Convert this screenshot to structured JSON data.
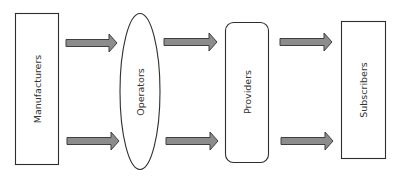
{
  "diagram": {
    "type": "flow",
    "direction": "left-to-right",
    "colors": {
      "background": "#ffffff",
      "node_stroke": "#2e2e2e",
      "node_fill": "#ffffff",
      "arrow_fill": "#8c8c8c",
      "arrow_stroke": "#3f3f3f",
      "label": "#333333"
    },
    "nodes": [
      {
        "id": "manufacturers",
        "label": "Manufacturers",
        "shape": "rectangle"
      },
      {
        "id": "operators",
        "label": "Operators",
        "shape": "ellipse"
      },
      {
        "id": "providers",
        "label": "Providers",
        "shape": "rounded-rectangle"
      },
      {
        "id": "subscribers",
        "label": "Subscribers",
        "shape": "rectangle"
      }
    ],
    "edges": [
      {
        "from": "manufacturers",
        "to": "operators",
        "position": "top"
      },
      {
        "from": "manufacturers",
        "to": "operators",
        "position": "bottom"
      },
      {
        "from": "operators",
        "to": "providers",
        "position": "top"
      },
      {
        "from": "operators",
        "to": "providers",
        "position": "bottom"
      },
      {
        "from": "providers",
        "to": "subscribers",
        "position": "top"
      },
      {
        "from": "providers",
        "to": "subscribers",
        "position": "bottom"
      }
    ]
  }
}
